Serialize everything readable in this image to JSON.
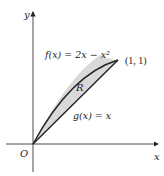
{
  "figure": {
    "type": "region-between-curves",
    "axes": {
      "x_label": "x",
      "y_label": "y",
      "origin_label": "O"
    },
    "curves": [
      {
        "name": "f",
        "label": "f(x) = 2x − x²",
        "expression": "2x - x^2"
      },
      {
        "name": "g",
        "label": "g(x) = x",
        "expression": "x"
      }
    ],
    "region": {
      "label": "R",
      "fill": "#d9d9d9"
    },
    "intersection_point": {
      "label": "(1, 1)",
      "x": 1,
      "y": 1
    },
    "colors": {
      "stroke": "#222222",
      "region_fill": "#d9d9d9",
      "background": "#ffffff"
    }
  }
}
